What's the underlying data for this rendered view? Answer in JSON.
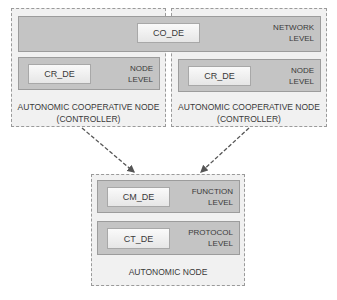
{
  "network": {
    "de": "CO_DE",
    "level_l1": "NETWORK",
    "level_l2": "LEVEL"
  },
  "controller_left": {
    "de": "CR_DE",
    "level_l1": "NODE",
    "level_l2": "LEVEL",
    "caption_l1": "AUTONOMIC COOPERATIVE NODE",
    "caption_l2": "(CONTROLLER)"
  },
  "controller_right": {
    "de": "CR_DE",
    "level_l1": "NODE",
    "level_l2": "LEVEL",
    "caption_l1": "AUTONOMIC COOPERATIVE NODE",
    "caption_l2": "(CONTROLLER)"
  },
  "autonomic_node": {
    "function": {
      "de": "CM_DE",
      "level_l1": "FUNCTION",
      "level_l2": "LEVEL"
    },
    "protocol": {
      "de": "CT_DE",
      "level_l1": "PROTOCOL",
      "level_l2": "LEVEL"
    },
    "caption": "AUTONOMIC NODE"
  },
  "colors": {
    "band": "#c4c4c4",
    "outer": "#f1f1f1",
    "arrow": "#555555"
  }
}
